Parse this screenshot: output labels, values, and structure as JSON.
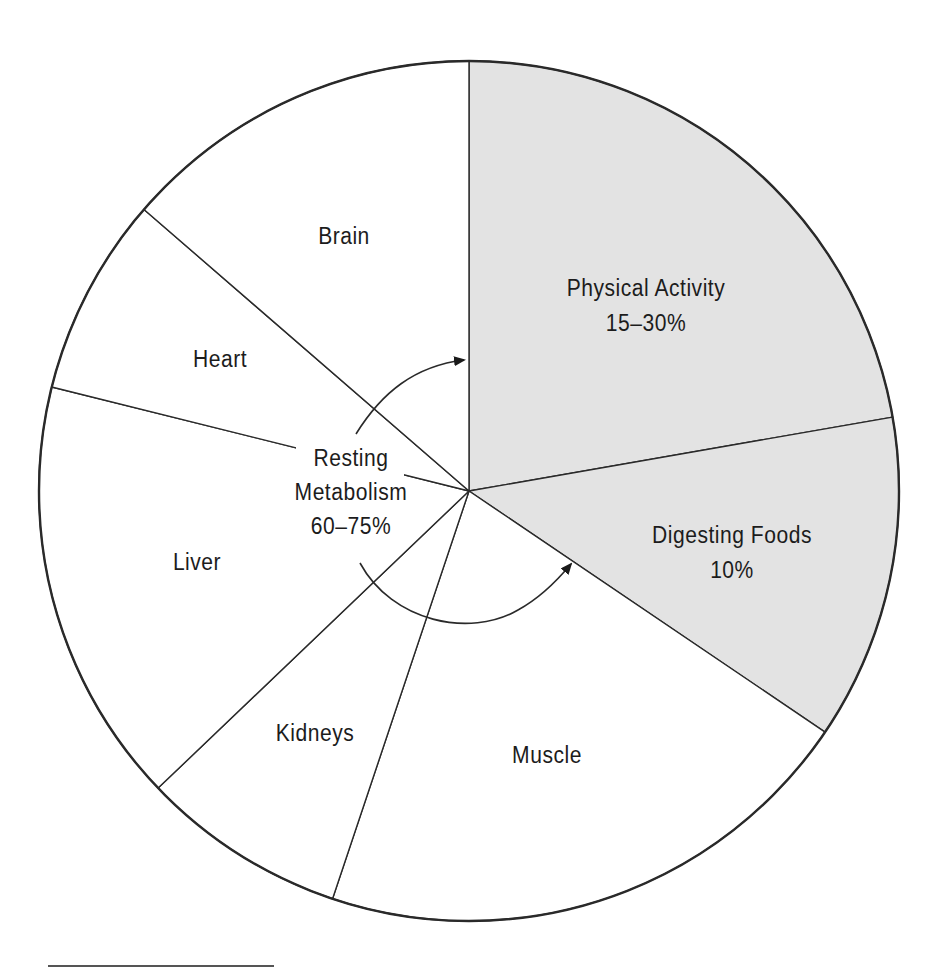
{
  "chart_data": {
    "type": "pie",
    "title": "",
    "center": [
      469,
      491
    ],
    "radius": 430,
    "start_angle_deg": 0,
    "direction": "clockwise",
    "colors": {
      "shaded": "#e3e3e3",
      "unshaded": "#ffffff",
      "stroke": "#2a2a2a"
    },
    "slices": [
      {
        "name": "Physical Activity",
        "label": "Physical Activity",
        "value_label": "15–30%",
        "share_pct": 22.3,
        "start_deg": 0,
        "end_deg": 80.1,
        "shaded": true,
        "group": "Physical Activity"
      },
      {
        "name": "Digesting Foods",
        "label": "Digesting Foods",
        "value_label": "10%",
        "share_pct": 12.2,
        "start_deg": 80.1,
        "end_deg": 124.1,
        "shaded": true,
        "group": "Digesting Foods"
      },
      {
        "name": "Muscle",
        "label": "Muscle",
        "value_label": "",
        "share_pct": 20.7,
        "start_deg": 124.1,
        "end_deg": 198.5,
        "shaded": false,
        "group": "Resting Metabolism"
      },
      {
        "name": "Kidneys",
        "label": "Kidneys",
        "value_label": "",
        "share_pct": 7.7,
        "start_deg": 198.5,
        "end_deg": 226.3,
        "shaded": false,
        "group": "Resting Metabolism"
      },
      {
        "name": "Liver",
        "label": "Liver",
        "value_label": "",
        "share_pct": 16.0,
        "start_deg": 226.3,
        "end_deg": 284.0,
        "shaded": false,
        "group": "Resting Metabolism"
      },
      {
        "name": "Heart",
        "label": "Heart",
        "value_label": "",
        "share_pct": 7.5,
        "start_deg": 284.0,
        "end_deg": 310.9,
        "shaded": false,
        "group": "Resting Metabolism"
      },
      {
        "name": "Brain",
        "label": "Brain",
        "value_label": "",
        "share_pct": 13.6,
        "start_deg": 310.9,
        "end_deg": 360,
        "shaded": false,
        "group": "Resting Metabolism"
      }
    ],
    "annotations": [
      {
        "text": [
          "Resting",
          "Metabolism",
          "60–75%"
        ],
        "position": "center-left",
        "note": "curved arrows point from this label toward Physical Activity and Digesting Foods slices"
      }
    ],
    "legend": null,
    "grid": false
  },
  "labels": {
    "brain": "Brain",
    "heart": "Heart",
    "liver": "Liver",
    "kidneys": "Kidneys",
    "muscle": "Muscle",
    "physical_activity": "Physical Activity",
    "physical_activity_value": "15–30%",
    "digesting_foods": "Digesting Foods",
    "digesting_foods_value": "10%",
    "resting_line1": "Resting",
    "resting_line2": "Metabolism",
    "resting_value": "60–75%"
  }
}
